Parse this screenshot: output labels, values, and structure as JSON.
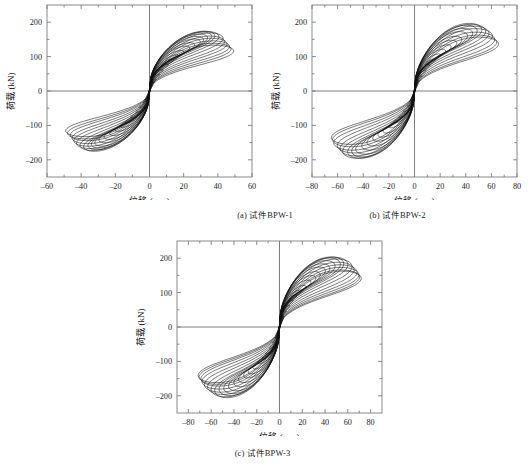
{
  "figure": {
    "background": "#ffffff",
    "curve_color": "#111111",
    "axis_color": "#7d7d7d",
    "panels": [
      {
        "id": "a",
        "caption": "(a) 试件BPW-1"
      },
      {
        "id": "b",
        "caption": "(b) 试件BPW-2"
      },
      {
        "id": "c",
        "caption": "(c) 试件BPW-3"
      }
    ]
  },
  "chart_data": [
    {
      "type": "line",
      "id": "a",
      "title": "(a) 试件BPW-1",
      "xlabel": "位移 (mm)",
      "ylabel": "荷载 (kN)",
      "xlim": [
        -60,
        60
      ],
      "ylim": [
        -250,
        250
      ],
      "xticks": [
        -60,
        -40,
        -20,
        0,
        20,
        40,
        60
      ],
      "yticks": [
        -200,
        -100,
        0,
        100,
        200
      ],
      "xtick_labels": [
        "–60",
        "–40",
        "–20",
        "0",
        "20",
        "40",
        "60"
      ],
      "ytick_labels": [
        "–200",
        "–100",
        "0",
        "100",
        "200"
      ],
      "grid": false,
      "legend": "none",
      "description": "Hysteretic load-displacement loops, pinched S-shape, 22 cycles of increasing amplitude",
      "cycles": [
        {
          "dx": 3,
          "dy": 26,
          "pinch": 0.3,
          "bulge": 0.2,
          "skew": 0.05
        },
        {
          "dx": 4,
          "dy": 34,
          "pinch": 0.3,
          "bulge": 0.22,
          "skew": 0.05
        },
        {
          "dx": 6,
          "dy": 48,
          "pinch": 0.32,
          "bulge": 0.25,
          "skew": 0.06
        },
        {
          "dx": 8,
          "dy": 62,
          "pinch": 0.33,
          "bulge": 0.28,
          "skew": 0.06
        },
        {
          "dx": 11,
          "dy": 78,
          "pinch": 0.34,
          "bulge": 0.32,
          "skew": 0.07
        },
        {
          "dx": 14,
          "dy": 92,
          "pinch": 0.35,
          "bulge": 0.36,
          "skew": 0.07
        },
        {
          "dx": 17,
          "dy": 104,
          "pinch": 0.36,
          "bulge": 0.4,
          "skew": 0.08
        },
        {
          "dx": 20,
          "dy": 116,
          "pinch": 0.37,
          "bulge": 0.44,
          "skew": 0.08
        },
        {
          "dx": 23,
          "dy": 128,
          "pinch": 0.38,
          "bulge": 0.48,
          "skew": 0.09
        },
        {
          "dx": 26,
          "dy": 138,
          "pinch": 0.39,
          "bulge": 0.52,
          "skew": 0.09
        },
        {
          "dx": 29,
          "dy": 148,
          "pinch": 0.4,
          "bulge": 0.56,
          "skew": 0.1
        },
        {
          "dx": 31,
          "dy": 156,
          "pinch": 0.41,
          "bulge": 0.6,
          "skew": 0.1
        },
        {
          "dx": 33,
          "dy": 162,
          "pinch": 0.42,
          "bulge": 0.64,
          "skew": 0.11
        },
        {
          "dx": 35,
          "dy": 167,
          "pinch": 0.43,
          "bulge": 0.68,
          "skew": 0.11
        },
        {
          "dx": 37,
          "dy": 170,
          "pinch": 0.44,
          "bulge": 0.72,
          "skew": 0.12
        },
        {
          "dx": 39,
          "dy": 168,
          "pinch": 0.45,
          "bulge": 0.76,
          "skew": 0.12
        },
        {
          "dx": 41,
          "dy": 163,
          "pinch": 0.46,
          "bulge": 0.8,
          "skew": 0.13
        },
        {
          "dx": 42,
          "dy": 155,
          "pinch": 0.47,
          "bulge": 0.84,
          "skew": 0.13
        },
        {
          "dx": 43,
          "dy": 148,
          "pinch": 0.48,
          "bulge": 0.88,
          "skew": 0.14
        },
        {
          "dx": 44,
          "dy": 140,
          "pinch": 0.49,
          "bulge": 0.92,
          "skew": 0.14
        },
        {
          "dx": 45,
          "dy": 134,
          "pinch": 0.5,
          "bulge": 0.96,
          "skew": 0.15
        },
        {
          "dx": 46,
          "dy": 128,
          "pinch": 0.51,
          "bulge": 1.0,
          "skew": 0.15
        }
      ],
      "peak_positive_load": 172,
      "peak_negative_load": -205,
      "max_positive_disp": 46,
      "max_negative_disp": -48
    },
    {
      "type": "line",
      "id": "b",
      "title": "(b) 试件BPW-2",
      "xlabel": "位移 (mm)",
      "ylabel": "荷载 (kN)",
      "xlim": [
        -80,
        80
      ],
      "ylim": [
        -250,
        250
      ],
      "xticks": [
        -80,
        -60,
        -40,
        -20,
        0,
        20,
        40,
        60,
        80
      ],
      "yticks": [
        -200,
        -100,
        0,
        100,
        200
      ],
      "xtick_labels": [
        "–80",
        "–60",
        "–40",
        "–20",
        "0",
        "20",
        "40",
        "60",
        "80"
      ],
      "ytick_labels": [
        "–200",
        "–100",
        "0",
        "100",
        "200"
      ],
      "grid": false,
      "legend": "none",
      "description": "Hysteretic load-displacement loops, pinched S-shape, 20 cycles of increasing amplitude",
      "cycles": [
        {
          "dx": 4,
          "dy": 30,
          "pinch": 0.3,
          "bulge": 0.2,
          "skew": 0.05
        },
        {
          "dx": 6,
          "dy": 44,
          "pinch": 0.31,
          "bulge": 0.23,
          "skew": 0.05
        },
        {
          "dx": 9,
          "dy": 60,
          "pinch": 0.32,
          "bulge": 0.27,
          "skew": 0.06
        },
        {
          "dx": 12,
          "dy": 76,
          "pinch": 0.33,
          "bulge": 0.31,
          "skew": 0.06
        },
        {
          "dx": 16,
          "dy": 92,
          "pinch": 0.35,
          "bulge": 0.36,
          "skew": 0.07
        },
        {
          "dx": 20,
          "dy": 106,
          "pinch": 0.36,
          "bulge": 0.41,
          "skew": 0.08
        },
        {
          "dx": 24,
          "dy": 120,
          "pinch": 0.37,
          "bulge": 0.46,
          "skew": 0.08
        },
        {
          "dx": 28,
          "dy": 132,
          "pinch": 0.39,
          "bulge": 0.51,
          "skew": 0.09
        },
        {
          "dx": 32,
          "dy": 144,
          "pinch": 0.4,
          "bulge": 0.56,
          "skew": 0.09
        },
        {
          "dx": 36,
          "dy": 156,
          "pinch": 0.41,
          "bulge": 0.61,
          "skew": 0.1
        },
        {
          "dx": 40,
          "dy": 168,
          "pinch": 0.42,
          "bulge": 0.66,
          "skew": 0.1
        },
        {
          "dx": 44,
          "dy": 178,
          "pinch": 0.44,
          "bulge": 0.71,
          "skew": 0.11
        },
        {
          "dx": 47,
          "dy": 186,
          "pinch": 0.45,
          "bulge": 0.76,
          "skew": 0.11
        },
        {
          "dx": 50,
          "dy": 190,
          "pinch": 0.46,
          "bulge": 0.81,
          "skew": 0.12
        },
        {
          "dx": 53,
          "dy": 188,
          "pinch": 0.47,
          "bulge": 0.86,
          "skew": 0.12
        },
        {
          "dx": 55,
          "dy": 182,
          "pinch": 0.48,
          "bulge": 0.9,
          "skew": 0.13
        },
        {
          "dx": 57,
          "dy": 174,
          "pinch": 0.49,
          "bulge": 0.94,
          "skew": 0.13
        },
        {
          "dx": 59,
          "dy": 165,
          "pinch": 0.5,
          "bulge": 0.97,
          "skew": 0.14
        },
        {
          "dx": 60,
          "dy": 156,
          "pinch": 0.51,
          "bulge": 0.99,
          "skew": 0.14
        },
        {
          "dx": 61,
          "dy": 150,
          "pinch": 0.52,
          "bulge": 1.0,
          "skew": 0.15
        }
      ],
      "peak_positive_load": 192,
      "peak_negative_load": -198,
      "max_positive_disp": 62,
      "max_negative_disp": -63
    },
    {
      "type": "line",
      "id": "c",
      "title": "(c) 试件BPW-3",
      "xlabel": "位移 (mm)",
      "ylabel": "荷载 (kN)",
      "xlim": [
        -90,
        90
      ],
      "ylim": [
        -250,
        250
      ],
      "xticks": [
        -80,
        -60,
        -40,
        -20,
        0,
        20,
        40,
        60,
        80
      ],
      "yticks": [
        -200,
        -100,
        0,
        100,
        200
      ],
      "xtick_labels": [
        "–80",
        "–60",
        "–40",
        "–20",
        "0",
        "20",
        "40",
        "60",
        "80"
      ],
      "ytick_labels": [
        "–200",
        "–100",
        "0",
        "100",
        "200"
      ],
      "grid": false,
      "legend": "none",
      "description": "Hysteretic load-displacement loops, pinched S-shape, 22 cycles of increasing amplitude",
      "cycles": [
        {
          "dx": 4,
          "dy": 32,
          "pinch": 0.28,
          "bulge": 0.18,
          "skew": 0.05
        },
        {
          "dx": 6,
          "dy": 46,
          "pinch": 0.29,
          "bulge": 0.21,
          "skew": 0.05
        },
        {
          "dx": 9,
          "dy": 62,
          "pinch": 0.3,
          "bulge": 0.25,
          "skew": 0.06
        },
        {
          "dx": 12,
          "dy": 78,
          "pinch": 0.32,
          "bulge": 0.29,
          "skew": 0.06
        },
        {
          "dx": 15,
          "dy": 92,
          "pinch": 0.33,
          "bulge": 0.33,
          "skew": 0.07
        },
        {
          "dx": 19,
          "dy": 106,
          "pinch": 0.34,
          "bulge": 0.38,
          "skew": 0.07
        },
        {
          "dx": 23,
          "dy": 120,
          "pinch": 0.36,
          "bulge": 0.43,
          "skew": 0.08
        },
        {
          "dx": 27,
          "dy": 134,
          "pinch": 0.37,
          "bulge": 0.48,
          "skew": 0.08
        },
        {
          "dx": 31,
          "dy": 146,
          "pinch": 0.38,
          "bulge": 0.53,
          "skew": 0.09
        },
        {
          "dx": 35,
          "dy": 158,
          "pinch": 0.4,
          "bulge": 0.58,
          "skew": 0.09
        },
        {
          "dx": 39,
          "dy": 170,
          "pinch": 0.41,
          "bulge": 0.63,
          "skew": 0.1
        },
        {
          "dx": 43,
          "dy": 180,
          "pinch": 0.42,
          "bulge": 0.68,
          "skew": 0.1
        },
        {
          "dx": 47,
          "dy": 188,
          "pinch": 0.44,
          "bulge": 0.73,
          "skew": 0.11
        },
        {
          "dx": 51,
          "dy": 194,
          "pinch": 0.45,
          "bulge": 0.78,
          "skew": 0.11
        },
        {
          "dx": 54,
          "dy": 198,
          "pinch": 0.46,
          "bulge": 0.83,
          "skew": 0.12
        },
        {
          "dx": 57,
          "dy": 196,
          "pinch": 0.47,
          "bulge": 0.87,
          "skew": 0.12
        },
        {
          "dx": 60,
          "dy": 190,
          "pinch": 0.48,
          "bulge": 0.9,
          "skew": 0.13
        },
        {
          "dx": 62,
          "dy": 182,
          "pinch": 0.49,
          "bulge": 0.93,
          "skew": 0.13
        },
        {
          "dx": 64,
          "dy": 174,
          "pinch": 0.5,
          "bulge": 0.96,
          "skew": 0.14
        },
        {
          "dx": 65,
          "dy": 166,
          "pinch": 0.51,
          "bulge": 0.98,
          "skew": 0.14
        },
        {
          "dx": 66,
          "dy": 160,
          "pinch": 0.52,
          "bulge": 0.99,
          "skew": 0.15
        },
        {
          "dx": 67,
          "dy": 156,
          "pinch": 0.53,
          "bulge": 1.0,
          "skew": 0.15
        }
      ],
      "peak_positive_load": 200,
      "peak_negative_load": -196,
      "max_positive_disp": 68,
      "max_negative_disp": -66
    }
  ]
}
